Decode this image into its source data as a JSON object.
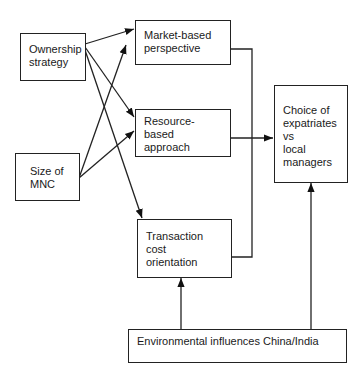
{
  "diagram": {
    "nodes": {
      "ownership": {
        "label": "Ownership\nstrategy"
      },
      "size": {
        "label": "Size of\nMNC"
      },
      "market": {
        "label": "Market-based\nperspective"
      },
      "resource": {
        "label": "Resource-\nbased\napproach"
      },
      "transaction": {
        "label": "Transaction\ncost\norientation"
      },
      "choice": {
        "label": "Choice of\nexpatriates\nvs\nlocal\nmanagers"
      },
      "environment": {
        "label": "Environmental influences China/India"
      }
    },
    "edges": [
      {
        "from": "ownership",
        "to": "market"
      },
      {
        "from": "ownership",
        "to": "resource"
      },
      {
        "from": "ownership",
        "to": "transaction"
      },
      {
        "from": "size",
        "to": "market"
      },
      {
        "from": "size",
        "to": "resource"
      },
      {
        "from": "market",
        "to": "choice"
      },
      {
        "from": "resource",
        "to": "choice"
      },
      {
        "from": "transaction",
        "to": "choice"
      },
      {
        "from": "environment",
        "to": "transaction"
      },
      {
        "from": "environment",
        "to": "choice"
      }
    ]
  }
}
